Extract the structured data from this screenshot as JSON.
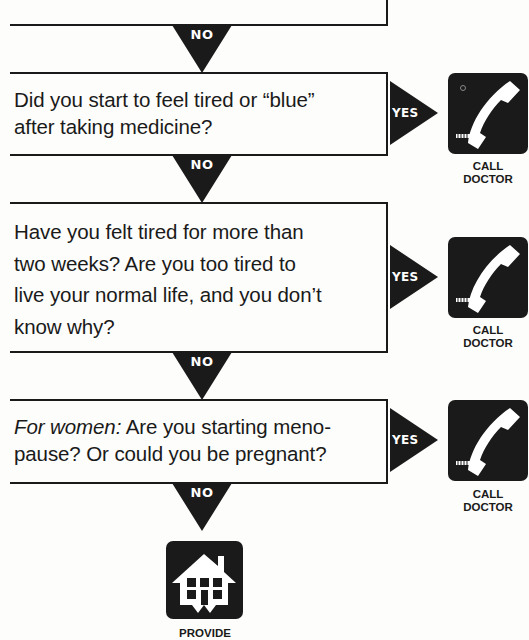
{
  "flowchart": {
    "box1": {
      "text": "• Seizure, convulsion or fit"
    },
    "box2": {
      "line1": "Did you start to feel tired or “blue”",
      "line2": "after taking medicine?"
    },
    "box3": {
      "line1": "Have you felt tired for more than",
      "line2": "two weeks? Are you too tired to",
      "line3": "live your normal life, and you don’t",
      "line4": "know why?"
    },
    "box4": {
      "prefix_italic": "For women:",
      "line1_rest": " Are you starting meno-",
      "line2": "pause? Or could you be pregnant?"
    },
    "connectors": {
      "no_label": "NO",
      "yes_label": "YES"
    },
    "outcomes": {
      "call_doctor": {
        "icon": "telephone-icon",
        "line1": "CALL",
        "line2": "DOCTOR"
      },
      "provide": {
        "icon": "house-icon",
        "line1": "PROVIDE"
      }
    },
    "colors": {
      "ink": "#1a1a1a",
      "paper": "#fdfdfb"
    }
  }
}
